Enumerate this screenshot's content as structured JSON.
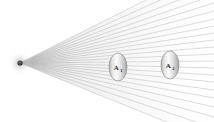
{
  "figure": {
    "canvas": {
      "width": 214,
      "height": 122,
      "background": "#ffffff"
    },
    "source": {
      "name": "point-light-source",
      "cx": 20,
      "cy": 63,
      "core_radius": 2.6,
      "halo_radius": 13,
      "core_color": "#3f3f3f",
      "halo_color": "#b9b9b9"
    },
    "rays": {
      "name": "ray-fan",
      "count": 22,
      "origin_x": 20,
      "origin_y": 63,
      "end_x": 214,
      "color": "#c4c4c4",
      "near_color": "#8f8f8f",
      "width": 0.6,
      "end_y_values": [
        -34,
        -24,
        -14,
        -5,
        3,
        11,
        19,
        26,
        33,
        40,
        47,
        54,
        61,
        68,
        75,
        82,
        90,
        98,
        107,
        117,
        128,
        141
      ]
    },
    "lenses": [
      {
        "name": "lens-a1",
        "label": "A",
        "subscript": "1",
        "cx": 118,
        "cy": 67,
        "rx": 9,
        "ry": 14,
        "fill_light": "#fcfcfc",
        "fill_mid": "#dcdcdc",
        "fill_dark": "#a8a8a8",
        "stroke": "#8c8c8c"
      },
      {
        "name": "lens-a2",
        "label": "A",
        "subscript": "2",
        "cx": 170,
        "cy": 65,
        "rx": 9,
        "ry": 14,
        "fill_light": "#fcfcfc",
        "fill_mid": "#dcdcdc",
        "fill_dark": "#a8a8a8",
        "stroke": "#8c8c8c"
      }
    ]
  }
}
